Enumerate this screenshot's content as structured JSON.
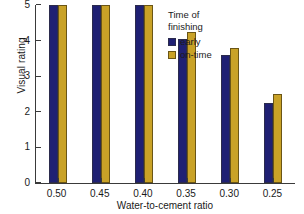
{
  "chart_data": {
    "type": "bar",
    "title": "",
    "xlabel": "Water-to-cement ratio",
    "ylabel": "Visual rating",
    "categories": [
      "0.50",
      "0.45",
      "0.40",
      "0.35",
      "0.30",
      "0.25"
    ],
    "series": [
      {
        "name": "early",
        "color": "#1F2073",
        "values": [
          5,
          5,
          5,
          4.05,
          3.6,
          2.25
        ]
      },
      {
        "name": "on-time",
        "color": "#C9A227",
        "values": [
          5,
          5,
          5,
          4.25,
          3.8,
          2.5
        ]
      }
    ],
    "ylim": [
      0,
      5
    ],
    "yticks": [
      0,
      1,
      2,
      3,
      4,
      5
    ],
    "ytick_labels": [
      "0",
      "1",
      "2",
      "3",
      "4",
      "5"
    ],
    "grid": false,
    "legend": {
      "title": "Time of\nfinishing",
      "position": "top-right-inside",
      "entries": [
        "early",
        "on-time"
      ]
    }
  }
}
